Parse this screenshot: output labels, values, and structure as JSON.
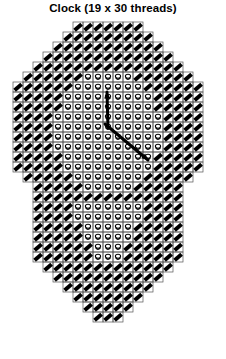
{
  "title": "Clock (19 x 30 threads)",
  "chart_data": {
    "type": "diagram",
    "title": "Clock (19 x 30 threads)",
    "grid": {
      "columns": 19,
      "rows": 30,
      "cell_px": 10,
      "origin_x": 13,
      "origin_y": 22,
      "show_grid": true,
      "grid_color": "#555555"
    },
    "legend_symbols": [
      {
        "name": "filled-diagonal-stitch",
        "fill": "#000000",
        "region": "border-band"
      },
      {
        "name": "open-loop-stitch",
        "fill": "#ffffff",
        "stroke": "#000000",
        "region": "clock-face"
      }
    ],
    "outline": {
      "description": "octagonal top with chamfered upper corners, straight sides, inward step at mid-left and mid-right, tapering to a point at the bottom",
      "columns_per_row": [
        {
          "row": 0,
          "start": 6,
          "end": 13
        },
        {
          "row": 1,
          "start": 5,
          "end": 14
        },
        {
          "row": 2,
          "start": 4,
          "end": 15
        },
        {
          "row": 3,
          "start": 3,
          "end": 16
        },
        {
          "row": 4,
          "start": 2,
          "end": 17
        },
        {
          "row": 5,
          "start": 1,
          "end": 18
        },
        {
          "row": 6,
          "start": 0,
          "end": 19
        },
        {
          "row": 7,
          "start": 0,
          "end": 19
        },
        {
          "row": 8,
          "start": 0,
          "end": 19
        },
        {
          "row": 9,
          "start": 0,
          "end": 19
        },
        {
          "row": 10,
          "start": 0,
          "end": 19
        },
        {
          "row": 11,
          "start": 0,
          "end": 19
        },
        {
          "row": 12,
          "start": 0,
          "end": 19
        },
        {
          "row": 13,
          "start": 0,
          "end": 19
        },
        {
          "row": 14,
          "start": 0,
          "end": 19
        },
        {
          "row": 15,
          "start": 1,
          "end": 18
        },
        {
          "row": 16,
          "start": 2,
          "end": 17
        },
        {
          "row": 17,
          "start": 2,
          "end": 17
        },
        {
          "row": 18,
          "start": 2,
          "end": 17
        },
        {
          "row": 19,
          "start": 2,
          "end": 17
        },
        {
          "row": 20,
          "start": 2,
          "end": 17
        },
        {
          "row": 21,
          "start": 2,
          "end": 17
        },
        {
          "row": 22,
          "start": 2,
          "end": 17
        },
        {
          "row": 23,
          "start": 2,
          "end": 17
        },
        {
          "row": 24,
          "start": 3,
          "end": 16
        },
        {
          "row": 25,
          "start": 4,
          "end": 15
        },
        {
          "row": 26,
          "start": 5,
          "end": 14
        },
        {
          "row": 27,
          "start": 6,
          "end": 13
        },
        {
          "row": 28,
          "start": 7,
          "end": 12
        },
        {
          "row": 29,
          "start": 8,
          "end": 11
        }
      ],
      "face_region": {
        "description": "inner oval of open-loop stitches representing the clock face",
        "rows_per_row": [
          {
            "row": 5,
            "start": 7,
            "end": 12
          },
          {
            "row": 6,
            "start": 6,
            "end": 13
          },
          {
            "row": 7,
            "start": 5,
            "end": 14
          },
          {
            "row": 8,
            "start": 5,
            "end": 14
          },
          {
            "row": 9,
            "start": 4,
            "end": 15
          },
          {
            "row": 10,
            "start": 4,
            "end": 15
          },
          {
            "row": 11,
            "start": 4,
            "end": 15
          },
          {
            "row": 12,
            "start": 4,
            "end": 15
          },
          {
            "row": 13,
            "start": 5,
            "end": 14
          },
          {
            "row": 14,
            "start": 5,
            "end": 14
          },
          {
            "row": 15,
            "start": 6,
            "end": 13
          },
          {
            "row": 16,
            "start": 7,
            "end": 12
          },
          {
            "row": 18,
            "start": 6,
            "end": 13
          },
          {
            "row": 19,
            "start": 6,
            "end": 13
          },
          {
            "row": 20,
            "start": 7,
            "end": 12
          },
          {
            "row": 21,
            "start": 7,
            "end": 12
          },
          {
            "row": 22,
            "start": 8,
            "end": 11
          },
          {
            "row": 23,
            "start": 8,
            "end": 11
          }
        ]
      }
    },
    "clock_hands": [
      {
        "name": "minute-hand",
        "from": [
          108,
          128
        ],
        "to": [
          107,
          92
        ],
        "direction": "up-slightly-left",
        "color": "#000000",
        "width": 3,
        "arrowhead": true
      },
      {
        "name": "hour-hand",
        "from": [
          105,
          124
        ],
        "to": [
          148,
          160
        ],
        "direction": "down-right",
        "color": "#000000",
        "width": 3,
        "arrowhead": true
      }
    ]
  }
}
